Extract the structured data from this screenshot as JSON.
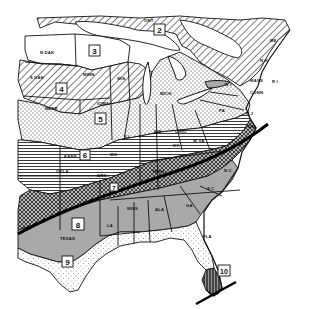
{
  "map": {
    "title": "Eastern United States zone map",
    "colors": {
      "ink": "#111111",
      "paper": "#ffffff",
      "gray_zone8": "#a9a9a9",
      "dark_zone": "#555555"
    },
    "zones": [
      {
        "id": "2",
        "label": "2",
        "pattern": "diagonal-hatch"
      },
      {
        "id": "3",
        "label": "3",
        "pattern": "blank"
      },
      {
        "id": "4",
        "label": "4",
        "pattern": "diagonal-hatch"
      },
      {
        "id": "5",
        "label": "5",
        "pattern": "stipple-dots"
      },
      {
        "id": "6",
        "label": "6",
        "pattern": "horizontal-lines"
      },
      {
        "id": "7",
        "label": "7",
        "pattern": "dark-crosshatch"
      },
      {
        "id": "8",
        "label": "8",
        "pattern": "gray-fill"
      },
      {
        "id": "9",
        "label": "9",
        "pattern": "light-stipple"
      },
      {
        "id": "10",
        "label": "10",
        "pattern": "dark-vertical"
      }
    ],
    "state_labels": {
      "ont": "ONT",
      "ndak": "N DAK",
      "sdak": "S DAK",
      "minn": "MINN",
      "wis": "WIS",
      "nebr": "NEBR",
      "iowa": "IOWA",
      "mich": "MICH",
      "ill": "ILL",
      "ind": "IND",
      "ohio": "OHIO",
      "pa": "PA",
      "ny": "N Y",
      "me": "ME",
      "nh": "N H",
      "mass": "MASS",
      "ri": "R I",
      "conn": "CONN",
      "nj": "N J",
      "del": "DEL",
      "wva": "W VA",
      "va": "VA",
      "ky": "KY",
      "kans": "KANS",
      "mo": "MO",
      "okla": "OKLA",
      "ark": "ARK",
      "tenn": "TENN",
      "nc": "N C",
      "sc": "S C",
      "ga": "GA",
      "ala": "ALA",
      "miss": "MISS",
      "la": "LA",
      "texas": "TEXAS",
      "fla": "FLA"
    }
  }
}
